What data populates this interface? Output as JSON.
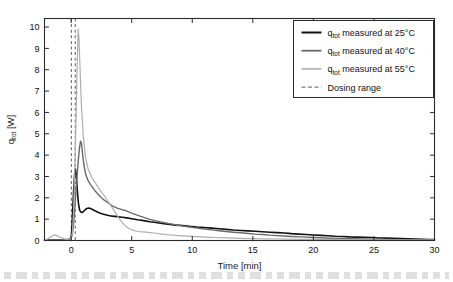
{
  "figure": {
    "background_color": "#ffffff",
    "frame_color": "#2b2b2b"
  },
  "chart_data": {
    "type": "line",
    "title": "",
    "xlabel": "Time [min]",
    "ylabel": "q_tot [W]",
    "ylabel_main": "q",
    "ylabel_sub": "tot",
    "ylabel_unit": " [W]",
    "xlim": [
      -2.2,
      30
    ],
    "ylim": [
      0,
      10.4
    ],
    "xticks": [
      0,
      5,
      10,
      15,
      20,
      25,
      30
    ],
    "xtick_labels": [
      "0",
      "5",
      "10",
      "15",
      "20",
      "25",
      "30"
    ],
    "yticks": [
      0,
      1,
      2,
      3,
      4,
      5,
      6,
      7,
      8,
      9,
      10
    ],
    "ytick_labels": [
      "0",
      "1",
      "2",
      "3",
      "4",
      "5",
      "6",
      "7",
      "8",
      "9",
      "10"
    ],
    "grid": false,
    "legend_position": "top-right",
    "annotations": [
      {
        "name": "dosing-range",
        "type": "vlines",
        "x_values": [
          0.02,
          0.34
        ],
        "style": "dashed",
        "color": "#6e6e6e"
      }
    ],
    "series": [
      {
        "name": "q_tot measured at 25°C",
        "temperature_c": 25,
        "color": "#121212",
        "width": 1.6,
        "peak": {
          "x": 0.35,
          "y": 3.35
        },
        "x": [
          -2.2,
          -1.6,
          -1.0,
          -0.5,
          -0.2,
          0.0,
          0.05,
          0.12,
          0.2,
          0.28,
          0.35,
          0.42,
          0.5,
          0.6,
          0.7,
          0.8,
          0.9,
          1.0,
          1.15,
          1.3,
          1.45,
          1.6,
          1.8,
          2.0,
          2.3,
          2.6,
          3.0,
          3.4,
          3.8,
          4.2,
          4.6,
          5.0,
          5.5,
          6.0,
          6.5,
          7.0,
          7.5,
          8.0,
          8.6,
          9.2,
          9.8,
          10.4,
          11.0,
          11.6,
          12.2,
          12.8,
          13.4,
          14.0,
          14.6,
          15.2,
          15.8,
          16.4,
          17.0,
          17.6,
          18.2,
          18.8,
          19.4,
          20.0,
          20.6,
          21.2,
          21.8,
          22.4,
          23.0,
          23.6,
          24.2,
          24.8,
          25.4,
          26.0,
          26.6,
          27.2,
          27.8,
          28.4,
          29.0,
          29.5,
          30.0
        ],
        "y": [
          0.02,
          0.02,
          0.02,
          0.03,
          0.05,
          0.1,
          0.45,
          1.3,
          2.3,
          3.05,
          3.35,
          3.1,
          2.4,
          1.75,
          1.42,
          1.33,
          1.31,
          1.35,
          1.44,
          1.5,
          1.52,
          1.5,
          1.44,
          1.38,
          1.3,
          1.24,
          1.18,
          1.14,
          1.12,
          1.09,
          1.06,
          1.02,
          0.97,
          0.93,
          0.88,
          0.84,
          0.8,
          0.76,
          0.72,
          0.7,
          0.66,
          0.63,
          0.61,
          0.58,
          0.55,
          0.52,
          0.49,
          0.47,
          0.45,
          0.43,
          0.41,
          0.39,
          0.37,
          0.35,
          0.32,
          0.3,
          0.28,
          0.26,
          0.24,
          0.22,
          0.2,
          0.19,
          0.17,
          0.16,
          0.15,
          0.14,
          0.12,
          0.11,
          0.1,
          0.09,
          0.08,
          0.07,
          0.06,
          0.05,
          0.04
        ]
      },
      {
        "name": "q_tot measured at 40°C",
        "temperature_c": 40,
        "color": "#6b6b6b",
        "width": 1.4,
        "peak": {
          "x": 0.78,
          "y": 4.65
        },
        "x": [
          -2.2,
          -1.6,
          -1.0,
          -0.5,
          -0.2,
          0.0,
          0.1,
          0.2,
          0.3,
          0.4,
          0.5,
          0.6,
          0.7,
          0.78,
          0.85,
          0.95,
          1.05,
          1.2,
          1.4,
          1.6,
          1.9,
          2.2,
          2.6,
          3.0,
          3.4,
          3.8,
          4.2,
          4.6,
          5.0,
          5.5,
          6.0,
          6.5,
          7.0,
          7.5,
          8.0,
          8.6,
          9.2,
          9.8,
          10.4,
          11.0,
          11.6,
          12.2,
          12.8,
          13.4,
          14.0,
          14.6,
          15.2,
          15.8,
          16.4,
          17.0,
          17.6,
          18.2,
          19.0,
          20.0,
          21.0,
          22.0,
          23.0,
          24.0,
          25.0,
          26.0,
          27.0,
          28.0,
          29.0,
          30.0
        ],
        "y": [
          0.02,
          0.02,
          0.02,
          0.03,
          0.06,
          0.12,
          0.3,
          0.75,
          1.5,
          2.35,
          3.1,
          3.8,
          4.4,
          4.65,
          4.55,
          4.05,
          3.55,
          3.1,
          2.8,
          2.62,
          2.38,
          2.18,
          1.95,
          1.78,
          1.62,
          1.52,
          1.45,
          1.38,
          1.28,
          1.18,
          1.08,
          0.99,
          0.92,
          0.86,
          0.8,
          0.74,
          0.68,
          0.63,
          0.58,
          0.54,
          0.5,
          0.46,
          0.42,
          0.39,
          0.36,
          0.33,
          0.3,
          0.28,
          0.25,
          0.23,
          0.21,
          0.19,
          0.17,
          0.14,
          0.12,
          0.1,
          0.08,
          0.07,
          0.06,
          0.05,
          0.04,
          0.04,
          0.03,
          0.03
        ]
      },
      {
        "name": "q_tot measured at 55°C",
        "temperature_c": 55,
        "color": "#adadad",
        "width": 1.2,
        "peak": {
          "x": 0.58,
          "y": 9.9
        },
        "x": [
          -2.2,
          -2.0,
          -1.8,
          -1.6,
          -1.4,
          -1.2,
          -1.0,
          -0.8,
          -0.6,
          -0.4,
          -0.2,
          0.0,
          0.1,
          0.2,
          0.3,
          0.4,
          0.5,
          0.58,
          0.65,
          0.75,
          0.85,
          1.0,
          1.2,
          1.4,
          1.7,
          2.0,
          2.4,
          2.8,
          3.2,
          3.6,
          4.0,
          4.4,
          4.8,
          5.2,
          5.6,
          6.0,
          6.5,
          7.0,
          7.5,
          8.0,
          8.6,
          9.2,
          10.0,
          11.0,
          12.0,
          13.0,
          14.0,
          15.0,
          16.0,
          17.0,
          18.0,
          19.0,
          20.0,
          22.0,
          24.0,
          26.0,
          28.0,
          30.0
        ],
        "y": [
          0.03,
          0.06,
          0.12,
          0.2,
          0.26,
          0.24,
          0.18,
          0.12,
          0.08,
          0.06,
          0.05,
          0.08,
          0.35,
          1.4,
          3.3,
          5.6,
          8.2,
          9.9,
          9.45,
          7.8,
          6.3,
          4.9,
          3.85,
          3.35,
          2.95,
          2.7,
          2.35,
          2.05,
          1.7,
          1.35,
          1.0,
          0.72,
          0.55,
          0.46,
          0.42,
          0.4,
          0.37,
          0.34,
          0.3,
          0.27,
          0.24,
          0.22,
          0.19,
          0.16,
          0.14,
          0.12,
          0.1,
          0.09,
          0.08,
          0.07,
          0.06,
          0.05,
          0.05,
          0.04,
          0.03,
          0.03,
          0.02,
          0.02
        ]
      }
    ],
    "legend": [
      {
        "label_main": "q",
        "label_sub": "tot",
        "label_rest": " measured at 25°C",
        "color": "#121212",
        "style": "solid",
        "width": 2.0
      },
      {
        "label_main": "q",
        "label_sub": "tot",
        "label_rest": " measured at 40°C",
        "color": "#6b6b6b",
        "style": "solid",
        "width": 1.8
      },
      {
        "label_main": "q",
        "label_sub": "tot",
        "label_rest": " measured at 55°C",
        "color": "#b0b0b0",
        "style": "solid",
        "width": 1.6
      },
      {
        "label_main": "",
        "label_sub": "",
        "label_rest": "Dosing range",
        "color": "#7a7a7a",
        "style": "dashed",
        "width": 1.4
      }
    ]
  }
}
